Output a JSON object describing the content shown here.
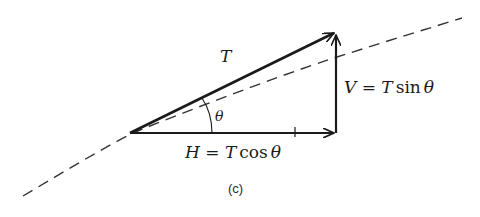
{
  "diagram": {
    "caption": "(c)",
    "labels": {
      "hypotenuse": "T",
      "angle": "θ",
      "horizontal_var": "H",
      "horizontal_eq": " = ",
      "horizontal_T": "T",
      "horizontal_fn": "cos",
      "horizontal_theta": "θ",
      "vertical_var": "V",
      "vertical_eq": " = ",
      "vertical_T": "T",
      "vertical_fn": "sin",
      "vertical_theta": "θ"
    },
    "colors": {
      "stroke": "#1a1a1a",
      "dashed_curve": "#333333",
      "background": "#ffffff"
    }
  }
}
